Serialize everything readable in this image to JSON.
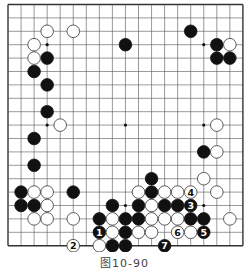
{
  "caption": "图10-90",
  "colors": {
    "background": "#ffffff",
    "grid": "#555555",
    "border": "#333333",
    "black_stone": "#111111",
    "white_stone": "#ffffff",
    "white_stroke": "#333333"
  },
  "board": {
    "size": 19,
    "left": 8,
    "top": 4.5,
    "dx": 13.05,
    "dy": 13.4,
    "star_points": [
      [
        3,
        3
      ],
      [
        9,
        3
      ],
      [
        15,
        3
      ],
      [
        3,
        9
      ],
      [
        9,
        9
      ],
      [
        15,
        9
      ],
      [
        3,
        15
      ],
      [
        9,
        15
      ],
      [
        15,
        15
      ]
    ],
    "stones": [
      {
        "c": 9,
        "r": 3,
        "color": "black"
      },
      {
        "c": 14,
        "r": 2,
        "color": "black"
      },
      {
        "c": 16,
        "r": 3,
        "color": "black"
      },
      {
        "c": 16,
        "r": 4,
        "color": "black"
      },
      {
        "c": 17,
        "r": 4,
        "color": "black"
      },
      {
        "c": 3,
        "r": 4,
        "color": "black"
      },
      {
        "c": 2,
        "r": 5,
        "color": "black"
      },
      {
        "c": 3,
        "r": 6,
        "color": "black"
      },
      {
        "c": 3,
        "r": 8,
        "color": "black"
      },
      {
        "c": 2,
        "r": 10,
        "color": "black"
      },
      {
        "c": 2,
        "r": 12,
        "color": "black"
      },
      {
        "c": 15,
        "r": 11,
        "color": "black"
      },
      {
        "c": 1,
        "r": 14,
        "color": "black"
      },
      {
        "c": 1,
        "r": 15,
        "color": "black"
      },
      {
        "c": 2,
        "r": 15,
        "color": "black"
      },
      {
        "c": 5,
        "r": 14,
        "color": "black"
      },
      {
        "c": 11,
        "r": 13,
        "color": "black"
      },
      {
        "c": 11,
        "r": 14,
        "color": "black"
      },
      {
        "c": 8,
        "r": 15,
        "color": "black"
      },
      {
        "c": 10,
        "r": 15,
        "color": "black"
      },
      {
        "c": 12,
        "r": 15,
        "color": "black"
      },
      {
        "c": 13,
        "r": 15,
        "color": "black"
      },
      {
        "c": 14,
        "r": 15,
        "color": "black",
        "label": "3"
      },
      {
        "c": 7,
        "r": 16,
        "color": "black"
      },
      {
        "c": 9,
        "r": 16,
        "color": "black"
      },
      {
        "c": 10,
        "r": 16,
        "color": "black"
      },
      {
        "c": 14,
        "r": 16,
        "color": "black"
      },
      {
        "c": 15,
        "r": 16,
        "color": "black"
      },
      {
        "c": 7,
        "r": 17,
        "color": "black",
        "label": "1"
      },
      {
        "c": 9,
        "r": 17,
        "color": "black"
      },
      {
        "c": 15,
        "r": 17,
        "color": "black",
        "label": "5"
      },
      {
        "c": 8,
        "r": 18,
        "color": "black"
      },
      {
        "c": 9,
        "r": 18,
        "color": "black"
      },
      {
        "c": 12,
        "r": 18,
        "color": "black",
        "label": "7"
      },
      {
        "c": 3,
        "r": 2,
        "color": "white"
      },
      {
        "c": 5,
        "r": 2,
        "color": "white"
      },
      {
        "c": 2,
        "r": 3,
        "color": "white"
      },
      {
        "c": 2,
        "r": 4,
        "color": "white"
      },
      {
        "c": 17,
        "r": 3,
        "color": "white"
      },
      {
        "c": 4,
        "r": 9,
        "color": "white"
      },
      {
        "c": 16,
        "r": 9,
        "color": "white"
      },
      {
        "c": 16,
        "r": 11,
        "color": "white"
      },
      {
        "c": 15,
        "r": 13,
        "color": "white"
      },
      {
        "c": 2,
        "r": 14,
        "color": "white"
      },
      {
        "c": 3,
        "r": 14,
        "color": "white"
      },
      {
        "c": 3,
        "r": 15,
        "color": "white"
      },
      {
        "c": 2,
        "r": 16,
        "color": "white"
      },
      {
        "c": 3,
        "r": 16,
        "color": "white"
      },
      {
        "c": 5,
        "r": 16,
        "color": "white"
      },
      {
        "c": 10,
        "r": 14,
        "color": "white"
      },
      {
        "c": 12,
        "r": 14,
        "color": "white"
      },
      {
        "c": 13,
        "r": 14,
        "color": "white"
      },
      {
        "c": 14,
        "r": 14,
        "color": "white",
        "label": "4"
      },
      {
        "c": 16,
        "r": 14,
        "color": "white"
      },
      {
        "c": 11,
        "r": 15,
        "color": "white"
      },
      {
        "c": 8,
        "r": 16,
        "color": "white"
      },
      {
        "c": 11,
        "r": 16,
        "color": "white"
      },
      {
        "c": 12,
        "r": 16,
        "color": "white"
      },
      {
        "c": 13,
        "r": 16,
        "color": "white"
      },
      {
        "c": 17,
        "r": 16,
        "color": "white"
      },
      {
        "c": 8,
        "r": 17,
        "color": "white"
      },
      {
        "c": 10,
        "r": 17,
        "color": "white"
      },
      {
        "c": 11,
        "r": 17,
        "color": "white"
      },
      {
        "c": 13,
        "r": 17,
        "color": "white",
        "label": "6"
      },
      {
        "c": 14,
        "r": 17,
        "color": "white"
      },
      {
        "c": 5,
        "r": 18,
        "color": "white",
        "label": "2"
      },
      {
        "c": 7,
        "r": 18,
        "color": "white"
      }
    ]
  }
}
